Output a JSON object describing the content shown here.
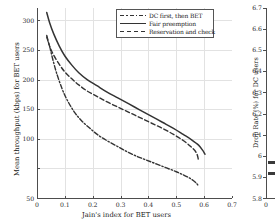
{
  "figure": {
    "kind": "two-panel-figure",
    "background": "#ffffff",
    "line_color": "#333333",
    "grid_color": "#e2e2e2",
    "axis_color": "#4d4d4d"
  },
  "legend": {
    "position": "top-right-inside",
    "entries": [
      {
        "label": "DC first, then BET",
        "style": "dashdot"
      },
      {
        "label": "Fair preemption",
        "style": "solid"
      },
      {
        "label": "Reservation and check",
        "style": "dash"
      }
    ]
  },
  "chart_data": [
    {
      "type": "line",
      "title": "",
      "xlabel": "Jain's index for BET users",
      "ylabel": "Mean throughput (kbps) for BET users",
      "xlim": [
        0,
        0.7
      ],
      "ylim": [
        50,
        300
      ],
      "xticks": [
        0,
        0.1,
        0.2,
        0.3,
        0.4,
        0.5,
        0.6,
        0.7
      ],
      "xticklabels": [
        "0",
        "0.1",
        "0.2",
        "0.3",
        "0.4",
        "0.5",
        "0.6",
        "0.7"
      ],
      "yticks": [
        50,
        100,
        150,
        200,
        250,
        300
      ],
      "yticklabels": [
        "50",
        "100",
        "150",
        "200",
        "250",
        "300"
      ],
      "grid": true,
      "legend_position": "upper right",
      "series": [
        {
          "name": "DC first, then BET",
          "style": "dashdot",
          "x": [
            0.035,
            0.045,
            0.055,
            0.07,
            0.09,
            0.11,
            0.135,
            0.16,
            0.19,
            0.22,
            0.255,
            0.29,
            0.325,
            0.36,
            0.395,
            0.43,
            0.465,
            0.5,
            0.53,
            0.555,
            0.572,
            0.58
          ],
          "y": [
            262,
            250,
            235,
            215,
            194,
            178,
            163,
            152,
            142,
            133,
            125,
            118,
            111,
            105,
            100,
            95,
            90,
            85,
            80,
            75,
            70,
            66
          ]
        },
        {
          "name": "Fair preemption",
          "style": "solid",
          "x": [
            0.035,
            0.045,
            0.06,
            0.08,
            0.1,
            0.125,
            0.15,
            0.18,
            0.215,
            0.25,
            0.29,
            0.33,
            0.37,
            0.41,
            0.45,
            0.49,
            0.525,
            0.555,
            0.58,
            0.595,
            0.603
          ],
          "y": [
            294,
            281,
            266,
            250,
            237,
            225,
            215,
            206,
            198,
            190,
            182,
            174,
            166,
            158,
            150,
            142,
            134,
            127,
            120,
            113,
            108
          ]
        },
        {
          "name": "Reservation and check",
          "style": "dash",
          "x": [
            0.035,
            0.045,
            0.06,
            0.08,
            0.1,
            0.125,
            0.15,
            0.18,
            0.215,
            0.25,
            0.29,
            0.33,
            0.37,
            0.41,
            0.45,
            0.49,
            0.525,
            0.552,
            0.572,
            0.58
          ],
          "y": [
            264,
            250,
            238,
            226,
            216,
            207,
            199,
            191,
            184,
            177,
            170,
            163,
            156,
            149,
            142,
            134,
            126,
            118,
            110,
            100
          ]
        }
      ]
    },
    {
      "type": "bar",
      "cropped": true,
      "ylabel": "Drop Rate (%) for DC users",
      "ylim": [
        5.8,
        6.7
      ],
      "yticks": [
        5.8,
        5.9,
        6.0,
        6.1,
        6.2,
        6.3,
        6.4,
        6.5,
        6.6,
        6.7
      ],
      "yticklabels": [
        "5.8",
        "5.9",
        "6",
        "6.1",
        "6.2",
        "6.3",
        "6.4",
        "6.5",
        "6.6",
        "6.7"
      ],
      "xticks": [
        0
      ],
      "xticklabels": [
        "0"
      ],
      "grid": false,
      "categories": [
        "bar-1",
        "bar-2"
      ],
      "values": [
        5.95,
        5.9
      ]
    }
  ]
}
